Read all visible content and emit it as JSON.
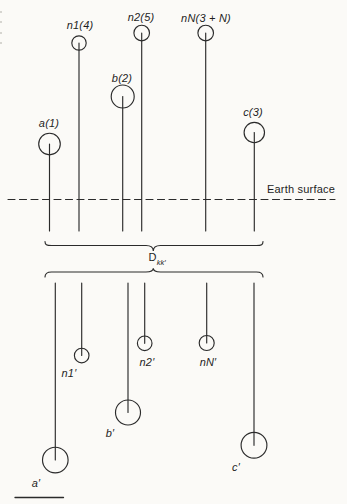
{
  "colors": {
    "paper": "#fbfaf7",
    "ink": "#2b2b2b"
  },
  "figure": {
    "surface_label": "Earth surface",
    "separation_label": {
      "base": "D",
      "sub": "kk′"
    },
    "top_electrodes": [
      {
        "name": "a",
        "label": "a(1)"
      },
      {
        "name": "n1",
        "label": "n1(4)"
      },
      {
        "name": "b",
        "label": "b(2)"
      },
      {
        "name": "n2",
        "label": "n2(5)"
      },
      {
        "name": "nN",
        "label": "nN(3 + N)"
      },
      {
        "name": "c",
        "label": "c(3)"
      }
    ],
    "bottom_electrodes": [
      {
        "name": "a-prime",
        "label": "a′"
      },
      {
        "name": "n1-prime",
        "label": "n1′"
      },
      {
        "name": "b-prime",
        "label": "b′"
      },
      {
        "name": "n2-prime",
        "label": "n2′"
      },
      {
        "name": "nN-prime",
        "label": "nN′"
      },
      {
        "name": "c-prime",
        "label": "c′"
      }
    ]
  }
}
